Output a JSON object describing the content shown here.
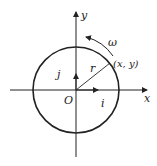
{
  "diagram": {
    "axes": {
      "x_label": "x",
      "y_label": "y",
      "origin_label": "O"
    },
    "unit_vectors": {
      "i": "i",
      "j": "j"
    },
    "radius_label": "r",
    "point_label": "(x, y)",
    "angular_velocity_label": "ω",
    "colors": {
      "stroke": "#222222",
      "background": "#ffffff"
    }
  }
}
